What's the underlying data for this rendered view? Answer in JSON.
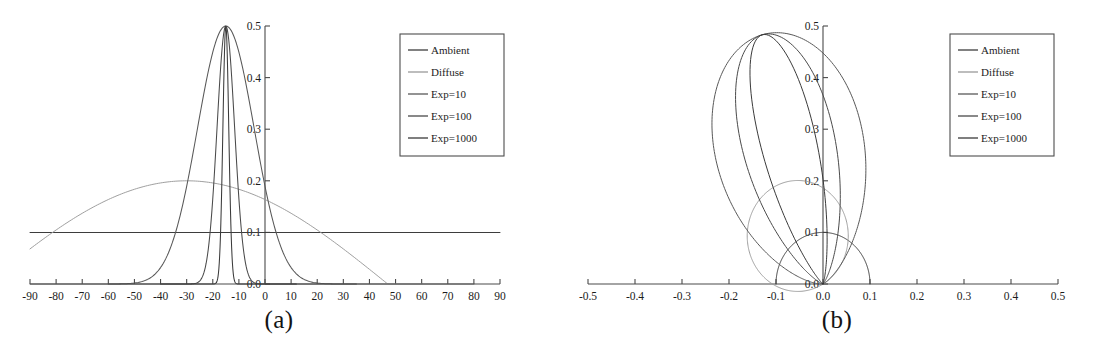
{
  "figure": {
    "panels": [
      {
        "id": "a",
        "caption": "(a)"
      },
      {
        "id": "b",
        "caption": "(b)"
      }
    ]
  },
  "legend": {
    "entries": [
      {
        "label": "Ambient",
        "color": "#3d3d3d"
      },
      {
        "label": "Diffuse",
        "color": "#9a9a9a"
      },
      {
        "label": "Exp=10",
        "color": "#585858"
      },
      {
        "label": "Exp=100",
        "color": "#4a4a4a"
      },
      {
        "label": "Exp=1000",
        "color": "#3a3a3a"
      }
    ]
  },
  "chart_data": [
    {
      "type": "line",
      "panel": "a",
      "caption": "(a)",
      "title": "",
      "xlabel": "",
      "ylabel": "",
      "xlim": [
        -90,
        90
      ],
      "ylim": [
        0.0,
        0.5
      ],
      "grid": false,
      "legend_position": "upper-right",
      "xticks": [
        -90,
        -80,
        -70,
        -60,
        -50,
        -40,
        -30,
        -20,
        -10,
        0,
        10,
        20,
        30,
        40,
        50,
        60,
        70,
        80,
        90
      ],
      "xtick_labels": [
        "-90",
        "-80",
        "-70",
        "-60",
        "-50",
        "-40",
        "-30",
        "-20",
        "-10",
        "0",
        "10",
        "20",
        "30",
        "40",
        "50",
        "60",
        "70",
        "80",
        "90"
      ],
      "yticks": [
        0.0,
        0.1,
        0.2,
        0.3,
        0.4,
        0.5
      ],
      "ytick_labels": [
        "0.0",
        "0.1",
        "0.2",
        "0.3",
        "0.4",
        "0.5"
      ],
      "peak_angle_deg": -15,
      "peak_value": 0.5,
      "series": [
        {
          "name": "Ambient",
          "color": "#3d3d3d",
          "description": "constant horizontal line at 0.1 across the full angular range",
          "x": [
            -90,
            -60,
            -30,
            0,
            30,
            60,
            90
          ],
          "values": [
            0.1,
            0.1,
            0.1,
            0.1,
            0.1,
            0.1,
            0.1
          ]
        },
        {
          "name": "Diffuse",
          "color": "#9a9a9a",
          "description": "broad cosine lobe peaking near 0.2 around -30 deg, falling to zero near -90 and +60",
          "x": [
            -90,
            -80,
            -70,
            -60,
            -50,
            -40,
            -30,
            -20,
            -10,
            0,
            10,
            20,
            30,
            40,
            50,
            60
          ],
          "values": [
            0.0,
            0.055,
            0.103,
            0.143,
            0.173,
            0.192,
            0.2,
            0.197,
            0.185,
            0.165,
            0.138,
            0.104,
            0.068,
            0.038,
            0.014,
            0.0
          ]
        },
        {
          "name": "Exp=10",
          "color": "#585858",
          "description": "broad specular lobe centered at -15 deg, peak 0.5, half-width about 25 deg",
          "x": [
            -70,
            -60,
            -50,
            -45,
            -40,
            -35,
            -30,
            -25,
            -20,
            -15,
            -10,
            -5,
            0,
            5,
            10,
            15,
            20,
            25,
            30,
            35,
            40,
            45,
            50
          ],
          "values": [
            0.0,
            0.004,
            0.022,
            0.044,
            0.08,
            0.137,
            0.212,
            0.3,
            0.395,
            0.5,
            0.395,
            0.3,
            0.212,
            0.137,
            0.08,
            0.044,
            0.022,
            0.01,
            0.004,
            0.0015,
            0.0005,
            0.0002,
            0.0
          ]
        },
        {
          "name": "Exp=100",
          "color": "#4a4a4a",
          "description": "narrow specular lobe centered at -15 deg, peak 0.5, half-width about 8 deg",
          "x": [
            -35,
            -30,
            -28,
            -26,
            -24,
            -22,
            -20,
            -18,
            -16,
            -15,
            -14,
            -12,
            -10,
            -8,
            -6,
            -4,
            -2,
            0,
            2,
            5
          ],
          "values": [
            0.0,
            0.004,
            0.016,
            0.047,
            0.11,
            0.21,
            0.325,
            0.435,
            0.49,
            0.5,
            0.49,
            0.41,
            0.3,
            0.19,
            0.1,
            0.042,
            0.013,
            0.003,
            0.0005,
            0.0
          ]
        },
        {
          "name": "Exp=1000",
          "color": "#3a3a3a",
          "description": "very narrow specular spike centered at -15 deg, peak 0.5, half-width about 2.5 deg",
          "x": [
            -22,
            -20,
            -19,
            -18,
            -17,
            -16,
            -15,
            -14,
            -13,
            -12,
            -11,
            -10,
            -8
          ],
          "values": [
            0.0,
            0.012,
            0.055,
            0.16,
            0.32,
            0.46,
            0.5,
            0.46,
            0.32,
            0.16,
            0.055,
            0.012,
            0.0
          ]
        }
      ]
    },
    {
      "type": "line",
      "panel": "b",
      "caption": "(b)",
      "title": "",
      "xlabel": "",
      "ylabel": "",
      "xlim": [
        -0.5,
        0.5
      ],
      "ylim": [
        0.0,
        0.5
      ],
      "grid": false,
      "legend_position": "upper-right",
      "projection_note": "polar representation of the same reflectance lobes plotted in Cartesian coordinates",
      "xticks": [
        -0.5,
        -0.4,
        -0.3,
        -0.2,
        -0.1,
        0.0,
        0.1,
        0.2,
        0.3,
        0.4,
        0.5
      ],
      "xtick_labels": [
        "-0.5",
        "-0.4",
        "-0.3",
        "-0.2",
        "-0.1",
        "0.0",
        "0.1",
        "0.2",
        "0.3",
        "0.4",
        "0.5"
      ],
      "yticks": [
        0.0,
        0.1,
        0.2,
        0.3,
        0.4,
        0.5
      ],
      "ytick_labels": [
        "0.0",
        "0.1",
        "0.2",
        "0.3",
        "0.4",
        "0.5"
      ],
      "lobe_peak_xy": [
        -0.129,
        0.483
      ],
      "series": [
        {
          "name": "Ambient",
          "color": "#3d3d3d",
          "description": "semicircle of radius 0.1 centred at origin",
          "radius": 0.1,
          "center": [
            0.0,
            0.0
          ]
        },
        {
          "name": "Diffuse",
          "color": "#9a9a9a",
          "description": "circle of radius 0.1 tangent to origin, centre at (-0.05, 0.096), representing cosine lobe",
          "radius": 0.108,
          "center": [
            -0.028,
            0.104
          ]
        },
        {
          "name": "Exp=10",
          "color": "#585858",
          "description": "widest specular polar lobe, tip at (-0.129, 0.483)",
          "lobe_tip": [
            -0.129,
            0.483
          ],
          "width_factor": 1.0
        },
        {
          "name": "Exp=100",
          "color": "#4a4a4a",
          "description": "narrower specular polar lobe, tip at (-0.129, 0.483)",
          "lobe_tip": [
            -0.129,
            0.483
          ],
          "width_factor": 0.55
        },
        {
          "name": "Exp=1000",
          "color": "#3a3a3a",
          "description": "narrowest specular polar lobe, tip at (-0.129, 0.483)",
          "lobe_tip": [
            -0.129,
            0.483
          ],
          "width_factor": 0.28
        }
      ]
    }
  ]
}
